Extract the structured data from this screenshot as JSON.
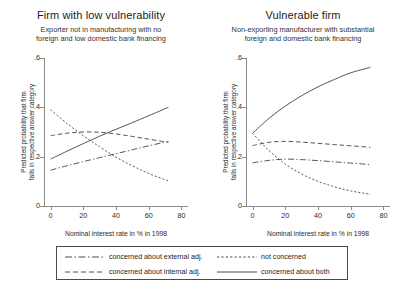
{
  "chart_data": {
    "type": "line",
    "title": "",
    "xlabel": "Nominal interest rate in % in 1998",
    "ylabel_line1": "Predicted probability that firm",
    "ylabel_line2": "falls in respective answer category",
    "xlim": [
      -4,
      84
    ],
    "ylim": [
      0,
      0.6
    ],
    "xticks": [
      0,
      20,
      40,
      60,
      80
    ],
    "xticklabels": [
      "0",
      "20",
      "40",
      "60",
      "80"
    ],
    "yticks": [
      0,
      0.2,
      0.4,
      0.6
    ],
    "yticklabels": [
      "0",
      ".2",
      ".4",
      ".6"
    ],
    "grid": false,
    "legend_position": "bottom",
    "panels": [
      {
        "title": "Firm with low vulnerability",
        "subtitle_line1": "Exporter not in manufacturing with no",
        "subtitle_line2": "foreign and low domestic bank financing",
        "x": [
          0,
          10,
          20,
          30,
          40,
          50,
          60,
          72
        ],
        "series": [
          {
            "name": "concerned about external adj.",
            "style": "dashdot",
            "values": [
              0.145,
              0.163,
              0.18,
              0.196,
              0.212,
              0.228,
              0.244,
              0.262
            ]
          },
          {
            "name": "not concerned",
            "style": "dotted",
            "values": [
              0.39,
              0.335,
              0.285,
              0.24,
              0.198,
              0.163,
              0.132,
              0.102
            ]
          },
          {
            "name": "concerned about internal adj.",
            "style": "dashed",
            "values": [
              0.285,
              0.295,
              0.3,
              0.299,
              0.292,
              0.282,
              0.271,
              0.258
            ]
          },
          {
            "name": "concerned about both",
            "style": "solid",
            "values": [
              0.19,
              0.222,
              0.253,
              0.283,
              0.311,
              0.338,
              0.366,
              0.4
            ]
          }
        ]
      },
      {
        "title": "Vulnerable firm",
        "subtitle_line1": "Non-exporting manufacturer with substantial",
        "subtitle_line2": "foreign and domestic bank financing",
        "x": [
          0,
          10,
          20,
          30,
          40,
          50,
          60,
          72
        ],
        "series": [
          {
            "name": "concerned about external adj.",
            "style": "dashdot",
            "values": [
              0.175,
              0.185,
              0.19,
              0.188,
              0.184,
              0.179,
              0.174,
              0.168
            ]
          },
          {
            "name": "not concerned",
            "style": "dotted",
            "values": [
              0.295,
              0.225,
              0.17,
              0.13,
              0.1,
              0.078,
              0.061,
              0.048
            ]
          },
          {
            "name": "concerned about internal adj.",
            "style": "dashed",
            "values": [
              0.245,
              0.258,
              0.262,
              0.259,
              0.254,
              0.249,
              0.244,
              0.238
            ]
          },
          {
            "name": "concerned about both",
            "style": "solid",
            "values": [
              0.295,
              0.355,
              0.405,
              0.447,
              0.483,
              0.513,
              0.54,
              0.562
            ]
          }
        ]
      }
    ],
    "legend": [
      {
        "label": "concerned about external adj.",
        "style": "dashdot"
      },
      {
        "label": "not concerned",
        "style": "dotted"
      },
      {
        "label": "concerned about internal adj.",
        "style": "dashed"
      },
      {
        "label": "concerned about both",
        "style": "solid"
      }
    ],
    "line_color": "#4d4d4d"
  }
}
